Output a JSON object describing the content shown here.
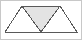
{
  "figure": {
    "kind": "geometric-diagram",
    "canvas": {
      "width": 82,
      "height": 40
    },
    "colors": {
      "background": "#ffffff",
      "stroke": "#595959",
      "frame_stroke": "#c8c8c8",
      "inner_triangle_fill": "#e3e3e3",
      "outer_triangle_fill": "#ffffff"
    },
    "stroke_width": 1,
    "frame": {
      "x": 0.5,
      "y": 0.5,
      "width": 81,
      "height": 39
    },
    "points": {
      "base_left": {
        "x": 5,
        "y": 32
      },
      "base_right": {
        "x": 77,
        "y": 32
      },
      "base_center": {
        "x": 41,
        "y": 32
      },
      "apex_left": {
        "x": 22,
        "y": 6
      },
      "apex_right": {
        "x": 60,
        "y": 6
      }
    },
    "shapes": [
      {
        "name": "inner-inverted-triangle",
        "orientation": "down",
        "fill": "#e3e3e3",
        "polygon": "22,6 60,6 41,32"
      },
      {
        "name": "left-upward-triangle",
        "orientation": "up",
        "fill": "none",
        "polygon": "5,32 41,32 22,6"
      },
      {
        "name": "right-upward-triangle",
        "orientation": "up",
        "fill": "none",
        "polygon": "41,32 77,32 60,6"
      }
    ],
    "segments": [
      {
        "name": "baseline",
        "x1": 5,
        "y1": 32,
        "x2": 77,
        "y2": 32
      },
      {
        "name": "top-edge",
        "x1": 22,
        "y1": 6,
        "x2": 60,
        "y2": 6
      },
      {
        "name": "left-outer-edge",
        "x1": 5,
        "y1": 32,
        "x2": 22,
        "y2": 6
      },
      {
        "name": "right-outer-edge",
        "x1": 77,
        "y1": 32,
        "x2": 60,
        "y2": 6
      },
      {
        "name": "left-inner-edge",
        "x1": 22,
        "y1": 6,
        "x2": 41,
        "y2": 32
      },
      {
        "name": "right-inner-edge",
        "x1": 60,
        "y1": 6,
        "x2": 41,
        "y2": 32
      }
    ]
  }
}
